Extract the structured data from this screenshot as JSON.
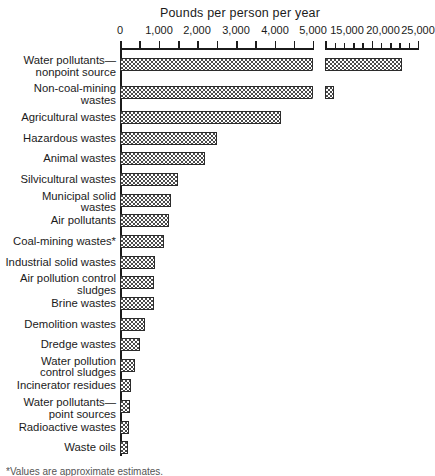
{
  "chart_data": {
    "type": "bar",
    "orientation": "horizontal",
    "title": "Pounds per person per year",
    "xlabel": "Pounds per person per year",
    "ylabel": "",
    "grid": false,
    "legend": null,
    "broken_axis": true,
    "axis_segments": [
      {
        "min": 0,
        "max": 5000,
        "ticks": [
          0,
          500,
          1000,
          1500,
          2000,
          2500,
          3000,
          3500,
          4000,
          4500,
          5000
        ],
        "labeled_ticks": [
          0,
          1000,
          2000,
          3000,
          4000,
          5000
        ]
      },
      {
        "min": 15000,
        "max": 25000,
        "ticks": [
          15000,
          16000,
          17000,
          18000,
          19000,
          20000,
          21000,
          22000,
          23000,
          24000,
          25000
        ],
        "labeled_ticks": [
          15000,
          20000,
          25000
        ]
      }
    ],
    "tick_labels": [
      "0",
      "1,000",
      "2,000",
      "3,000",
      "4,000",
      "5,000",
      "15,000",
      "20,000",
      "25,000"
    ],
    "categories": [
      "Water pollutants—\nnonpoint source",
      "Non-coal-mining\nwastes",
      "Agricultural wastes",
      "Hazardous wastes",
      "Animal wastes",
      "Silvicultural wastes",
      "Municipal solid\nwastes",
      "Air pollutants",
      "Coal-mining wastes*",
      "Industrial solid wastes",
      "Air pollution control\nsludges",
      "Brine wastes",
      "Demolition wastes",
      "Dredge wastes",
      "Water pollution\ncontrol sludges",
      "Incinerator residues",
      "Water pollutants—\npoint sources",
      "Radioactive wastes",
      "Waste oils"
    ],
    "values": [
      23300,
      16000,
      4170,
      2510,
      2200,
      1510,
      1330,
      1280,
      1150,
      900,
      880,
      870,
      640,
      510,
      380,
      290,
      260,
      230,
      210
    ],
    "footnote": "*Values are approximate estimates."
  },
  "axis": {
    "title": "Pounds per person per year"
  }
}
